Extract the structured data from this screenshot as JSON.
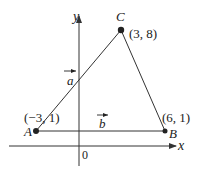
{
  "figure": {
    "axes": {
      "x_label": "x",
      "y_label": "y",
      "origin_label": "0"
    },
    "points": [
      {
        "name": "A",
        "coords": "(−3, 1)"
      },
      {
        "name": "B",
        "coords": "(6, 1)"
      },
      {
        "name": "C",
        "coords": "(3, 8)"
      }
    ],
    "vectors": [
      {
        "name": "a",
        "from": "A",
        "to": "C"
      },
      {
        "name": "b",
        "from": "A",
        "to": "B"
      }
    ],
    "colors": {
      "line": "#333333",
      "point": "#222222"
    }
  }
}
